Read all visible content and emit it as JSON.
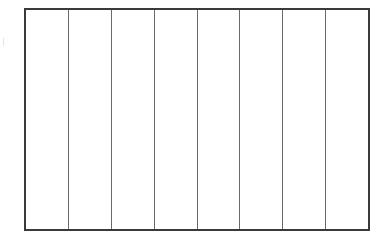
{
  "diagram": {
    "type": "rectangle-divided-into-equal-columns",
    "column_count": 8,
    "columns": [
      {
        "index": 1,
        "label": ""
      },
      {
        "index": 2,
        "label": ""
      },
      {
        "index": 3,
        "label": ""
      },
      {
        "index": 4,
        "label": ""
      },
      {
        "index": 5,
        "label": ""
      },
      {
        "index": 6,
        "label": ""
      },
      {
        "index": 7,
        "label": ""
      },
      {
        "index": 8,
        "label": ""
      }
    ],
    "colors": {
      "outer_border": "#3a3a3a",
      "divider": "#6a6a6a",
      "fill": "#ffffff"
    }
  }
}
